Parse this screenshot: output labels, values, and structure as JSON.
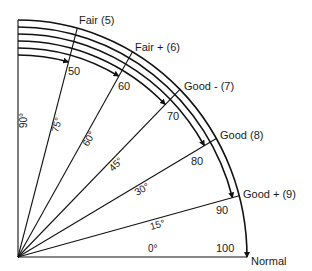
{
  "diagram": {
    "origin": {
      "x": 18,
      "y": 257
    },
    "outer_radius": {
      "rx": 229,
      "ry": 237
    },
    "arc_spacing": 7,
    "colors": {
      "stroke": "#111111",
      "text": "#1a1a1a",
      "background": "#ffffff"
    },
    "radial_lines": [
      {
        "angle": 0,
        "angle_label": "0°",
        "value_label": "100",
        "grade_label": "Normal"
      },
      {
        "angle": 15,
        "angle_label": "15°",
        "value_label": "90",
        "grade_label": "Good + (9)"
      },
      {
        "angle": 30,
        "angle_label": "30°",
        "value_label": "80",
        "grade_label": "Good (8)"
      },
      {
        "angle": 45,
        "angle_label": "45°",
        "value_label": "70",
        "grade_label": "Good - (7)"
      },
      {
        "angle": 60,
        "angle_label": "60°",
        "value_label": "60",
        "grade_label": "Fair + (6)"
      },
      {
        "angle": 75,
        "angle_label": "75°",
        "value_label": "50",
        "grade_label": "Fair (5)"
      },
      {
        "angle": 90,
        "angle_label": "90°",
        "value_label": "",
        "grade_label": ""
      }
    ],
    "arcs": [
      {
        "from_angle": 90,
        "to_angle": 0,
        "ends_at_value": "100"
      },
      {
        "from_angle": 90,
        "to_angle": 15,
        "ends_at_value": "90"
      },
      {
        "from_angle": 90,
        "to_angle": 30,
        "ends_at_value": "80"
      },
      {
        "from_angle": 90,
        "to_angle": 45,
        "ends_at_value": "70"
      },
      {
        "from_angle": 90,
        "to_angle": 60,
        "ends_at_value": "60"
      },
      {
        "from_angle": 90,
        "to_angle": 75,
        "ends_at_value": "50"
      }
    ],
    "labels": {
      "grades": [
        {
          "text": "Fair (5)",
          "x": 79,
          "y": 24
        },
        {
          "text": "Fair + (6)",
          "x": 135,
          "y": 51
        },
        {
          "text": "Good - (7)",
          "x": 184,
          "y": 90
        },
        {
          "text": "Good (8)",
          "x": 220,
          "y": 139
        },
        {
          "text": "Good + (9)",
          "x": 243,
          "y": 198
        },
        {
          "text": "Normal",
          "x": 251,
          "y": 265
        }
      ],
      "values": [
        {
          "text": "50",
          "x": 68,
          "y": 75
        },
        {
          "text": "60",
          "x": 118,
          "y": 90
        },
        {
          "text": "70",
          "x": 167,
          "y": 120
        },
        {
          "text": "80",
          "x": 191,
          "y": 165
        },
        {
          "text": "90",
          "x": 216,
          "y": 214
        },
        {
          "text": "100",
          "x": 216,
          "y": 252
        }
      ],
      "angles": [
        {
          "text": "90°",
          "x": 27,
          "y": 128,
          "rot": -90
        },
        {
          "text": "75°",
          "x": 58,
          "y": 133,
          "rot": -75
        },
        {
          "text": "60°",
          "x": 88,
          "y": 147,
          "rot": -60
        },
        {
          "text": "45°",
          "x": 113,
          "y": 172,
          "rot": -45
        },
        {
          "text": "30°",
          "x": 137,
          "y": 196,
          "rot": -30
        },
        {
          "text": "15°",
          "x": 151,
          "y": 230,
          "rot": -15
        },
        {
          "text": "0°",
          "x": 148,
          "y": 252,
          "rot": 0
        }
      ]
    }
  }
}
